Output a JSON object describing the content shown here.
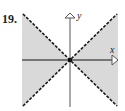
{
  "problem_number": "19.",
  "axes": {
    "x_label": "x",
    "y_label": "y"
  },
  "region": {
    "description": "Shaded region between dashed lines y = x and y = -x containing the x-axis (|y| < |x|)",
    "boundary_lines": [
      "y = x",
      "y = -x"
    ],
    "boundary_style": "dashed",
    "shade_color": "#d9d9d9",
    "line_color": "#1a1a1a",
    "axis_color": "#555555"
  }
}
